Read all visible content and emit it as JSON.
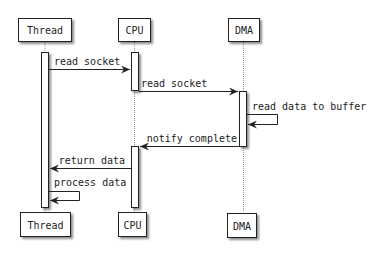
{
  "diagram": {
    "type": "sequence",
    "participants": [
      {
        "id": "thread",
        "label": "Thread"
      },
      {
        "id": "cpu",
        "label": "CPU"
      },
      {
        "id": "dma",
        "label": "DMA"
      }
    ],
    "messages": [
      {
        "from": "Thread",
        "to": "CPU",
        "label": "read socket"
      },
      {
        "from": "CPU",
        "to": "DMA",
        "label": "read socket"
      },
      {
        "from": "DMA",
        "to": "DMA",
        "label": "read data to buffer"
      },
      {
        "from": "DMA",
        "to": "CPU",
        "label": "notify complete"
      },
      {
        "from": "CPU",
        "to": "Thread",
        "label": "return data"
      },
      {
        "from": "Thread",
        "to": "Thread",
        "label": "process data"
      }
    ],
    "colors": {
      "line": "#222222",
      "lifeline": "#999999",
      "shadow": "#bbbbbb",
      "fill": "#ffffff"
    }
  }
}
